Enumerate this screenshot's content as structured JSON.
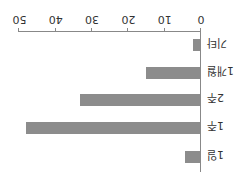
{
  "chart_data": {
    "type": "bar",
    "orientation": "horizontal",
    "rendered_rotation_deg": 180,
    "title": "",
    "xlabel": "",
    "ylabel": "",
    "categories": [
      "1일",
      "1주",
      "2주",
      "1개월",
      "기타"
    ],
    "values": [
      4,
      48,
      33,
      15,
      2
    ],
    "xlim": [
      0,
      50
    ],
    "xticks": [
      0,
      10,
      20,
      30,
      40,
      50
    ],
    "grid": false,
    "legend": null,
    "bar_color": "#8c8c8c"
  }
}
